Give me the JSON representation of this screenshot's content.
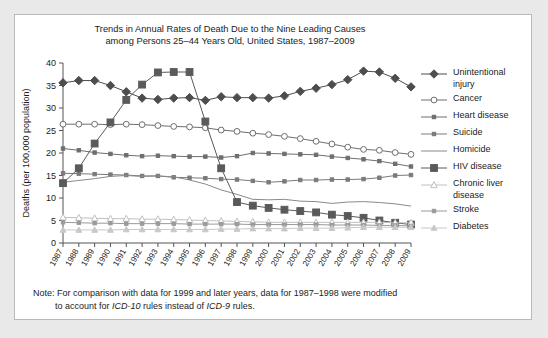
{
  "chart_data": {
    "type": "line",
    "title": "Trends in Annual Rates of Death Due to the Nine Leading Causes among Persons 25–44 Years Old, United States, 1987–2009",
    "title_line1": "Trends in Annual Rates of Death Due to the Nine Leading Causes",
    "title_line2": "among Persons 25–44 Years Old, United States, 1987–2009",
    "xlabel": "",
    "ylabel": "Deaths (per 100,000 population)",
    "ylim": [
      0,
      40
    ],
    "yticks": [
      0,
      5,
      10,
      15,
      20,
      25,
      30,
      35,
      40
    ],
    "grid": false,
    "legend_position": "right",
    "categories": [
      1987,
      1988,
      1989,
      1990,
      1991,
      1992,
      1993,
      1994,
      1995,
      1996,
      1997,
      1998,
      1999,
      2000,
      2001,
      2002,
      2003,
      2004,
      2005,
      2006,
      2007,
      2008,
      2009
    ],
    "x": [
      "1987",
      "1988",
      "1989",
      "1990",
      "1991",
      "1992",
      "1993",
      "1994",
      "1995",
      "1996",
      "1997",
      "1998",
      "1999",
      "2000",
      "2001",
      "2002",
      "2003",
      "2004",
      "2005",
      "2006",
      "2007",
      "2008",
      "2009"
    ],
    "series": [
      {
        "name": "Unintentional injury",
        "marker": "filled-diamond",
        "color": "#4d4d4d",
        "values": [
          35.6,
          36.1,
          36.1,
          35.0,
          33.6,
          32.2,
          31.9,
          32.2,
          32.3,
          31.7,
          32.5,
          32.3,
          32.3,
          32.2,
          32.7,
          33.7,
          34.4,
          35.2,
          36.3,
          38.2,
          38.0,
          36.6,
          34.7
        ]
      },
      {
        "name": "Cancer",
        "marker": "open-circle",
        "color": "#6e6e6e",
        "values": [
          26.4,
          26.4,
          26.4,
          26.3,
          26.4,
          26.3,
          26.1,
          25.9,
          25.8,
          25.6,
          25.1,
          24.8,
          24.4,
          24.1,
          23.7,
          23.2,
          22.6,
          22.0,
          21.3,
          20.8,
          20.6,
          20.1,
          19.7
        ]
      },
      {
        "name": "Heart disease",
        "marker": "small-filled",
        "color": "#6e6e6e",
        "values": [
          21.0,
          20.6,
          20.1,
          19.8,
          19.5,
          19.3,
          19.4,
          19.3,
          19.2,
          19.2,
          19.0,
          19.3,
          20.0,
          19.9,
          19.8,
          19.7,
          19.6,
          19.2,
          18.9,
          18.6,
          18.2,
          17.6,
          17.0
        ]
      },
      {
        "name": "Suicide",
        "marker": "small-filled",
        "color": "#7a7a7a",
        "values": [
          15.5,
          15.4,
          15.3,
          15.2,
          15.1,
          14.9,
          14.9,
          14.6,
          14.5,
          14.4,
          14.2,
          14.1,
          13.8,
          13.5,
          13.7,
          14.0,
          14.0,
          14.1,
          14.1,
          14.2,
          14.5,
          15.0,
          15.1
        ]
      },
      {
        "name": "Homicide",
        "marker": "none",
        "color": "#8a8a8a",
        "values": [
          13.5,
          13.9,
          14.3,
          14.8,
          15.0,
          14.8,
          14.9,
          14.7,
          14.0,
          13.1,
          11.8,
          10.8,
          9.7,
          9.6,
          9.7,
          9.3,
          9.2,
          8.8,
          9.1,
          9.2,
          9.0,
          8.7,
          8.2
        ]
      },
      {
        "name": "HIV disease",
        "marker": "filled-square",
        "color": "#5a5a5a",
        "values": [
          13.3,
          16.6,
          22.1,
          26.8,
          31.8,
          35.2,
          37.9,
          38.0,
          38.0,
          27.0,
          16.6,
          9.1,
          8.3,
          7.8,
          7.4,
          7.1,
          6.8,
          6.3,
          6.0,
          5.6,
          5.0,
          4.5,
          4.1
        ]
      },
      {
        "name": "Chronic liver disease",
        "marker": "open-triangle",
        "color": "#c0c0c0",
        "values": [
          5.7,
          5.6,
          5.5,
          5.4,
          5.4,
          5.3,
          5.3,
          5.2,
          5.1,
          5.0,
          4.9,
          4.8,
          4.7,
          4.6,
          4.6,
          4.6,
          4.6,
          4.6,
          4.6,
          4.6,
          4.6,
          4.5,
          4.5
        ]
      },
      {
        "name": "Stroke",
        "marker": "small-filled",
        "color": "#9a9a9a",
        "values": [
          4.6,
          4.5,
          4.4,
          4.4,
          4.3,
          4.3,
          4.3,
          4.3,
          4.2,
          4.2,
          4.2,
          4.2,
          4.1,
          4.1,
          4.1,
          4.1,
          4.1,
          4.0,
          4.0,
          4.0,
          3.9,
          3.9,
          3.8
        ]
      },
      {
        "name": "Diabetes",
        "marker": "small-triangle",
        "color": "#c8c8c8",
        "values": [
          2.9,
          2.9,
          2.9,
          2.9,
          3.0,
          3.0,
          3.0,
          3.0,
          3.0,
          3.0,
          3.1,
          3.1,
          3.2,
          3.2,
          3.2,
          3.3,
          3.3,
          3.3,
          3.4,
          3.5,
          3.5,
          3.5,
          3.5
        ]
      }
    ]
  },
  "legend": {
    "items": [
      {
        "label_line1": "Unintentional",
        "label_line2": "injury",
        "key": "filled-diamond"
      },
      {
        "label_line1": "Cancer",
        "label_line2": "",
        "key": "open-circle"
      },
      {
        "label_line1": "Heart disease",
        "label_line2": "",
        "key": "small-filled"
      },
      {
        "label_line1": "Suicide",
        "label_line2": "",
        "key": "small-filled"
      },
      {
        "label_line1": "Homicide",
        "label_line2": "",
        "key": "line"
      },
      {
        "label_line1": "HIV disease",
        "label_line2": "",
        "key": "filled-square"
      },
      {
        "label_line1": "Chronic liver",
        "label_line2": "disease",
        "key": "open-triangle"
      },
      {
        "label_line1": "Stroke",
        "label_line2": "",
        "key": "small-filled"
      },
      {
        "label_line1": "Diabetes",
        "label_line2": "",
        "key": "small-triangle"
      }
    ]
  },
  "note": {
    "line1_a": "Note: For comparison with data for 1999 and later years, data for 1987–1998 were modified",
    "line2_a": "to account for ",
    "line2_icd10": "ICD-10",
    "line2_b": " rules instead of ",
    "line2_icd9": "ICD-9",
    "line2_c": " rules."
  }
}
